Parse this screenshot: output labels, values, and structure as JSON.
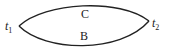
{
  "diagram": {
    "type": "two-path-lens",
    "nodes": [
      {
        "id": "t1",
        "label": "t",
        "subscript": "1",
        "x": 19,
        "y": 26
      },
      {
        "id": "t2",
        "label": "t",
        "subscript": "2",
        "x": 149,
        "y": 21
      }
    ],
    "edges": [
      {
        "id": "C",
        "label": "C",
        "from": "t1",
        "to": "t2",
        "position": "upper"
      },
      {
        "id": "B",
        "label": "B",
        "from": "t1",
        "to": "t2",
        "position": "lower"
      }
    ],
    "stroke_color": "#222222"
  }
}
